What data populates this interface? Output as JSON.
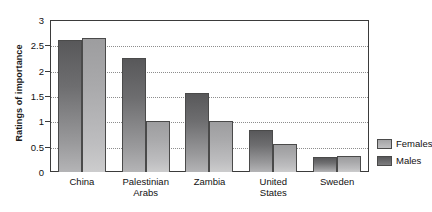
{
  "chart_data": {
    "type": "bar",
    "title": "",
    "xlabel": "",
    "ylabel": "Ratings of importance",
    "ylim": [
      0,
      3
    ],
    "ytick_labels": [
      "3",
      "2.5",
      "2",
      "1.5",
      "1",
      "0.5",
      "0"
    ],
    "ytick_values": [
      3,
      2.5,
      2,
      1.5,
      1,
      0.5,
      0
    ],
    "grid": "horizontal-dotted",
    "legend_position": "right",
    "categories": [
      "China",
      "Palestinian Arabs",
      "Zambia",
      "United States",
      "Sweden"
    ],
    "category_lines": [
      [
        "China"
      ],
      [
        "Palestinian",
        "Arabs"
      ],
      [
        "Zambia"
      ],
      [
        "United",
        "States"
      ],
      [
        "Sweden"
      ]
    ],
    "series": [
      {
        "name": "Males",
        "color": "#6e6e70",
        "values": [
          2.6,
          2.25,
          1.55,
          0.83,
          0.3
        ]
      },
      {
        "name": "Females",
        "color": "#b4b4b6",
        "values": [
          2.65,
          1.0,
          1.0,
          0.55,
          0.32
        ]
      }
    ]
  },
  "legend": {
    "items": [
      {
        "label": "Females",
        "swatch": "females-swatch"
      },
      {
        "label": "Males",
        "swatch": "males-swatch"
      }
    ]
  },
  "axes": {
    "y_title": "Ratings of importance"
  }
}
